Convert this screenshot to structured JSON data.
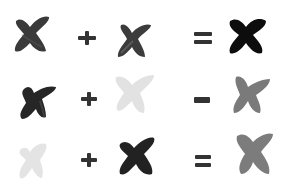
{
  "rows": [
    {
      "operand_a": {
        "shape": "x-brush-mark",
        "color": "#3a3a3a"
      },
      "operator1": "plus",
      "operand_b": {
        "shape": "x-brush-mark",
        "color": "#3c3c3c"
      },
      "operator2": "equals",
      "result": {
        "shape": "x-brush-mark",
        "color": "#0d0d0d"
      }
    },
    {
      "operand_a": {
        "shape": "x-brush-mark",
        "color": "#262626"
      },
      "operator1": "plus",
      "operand_b": {
        "shape": "x-brush-mark",
        "color": "#e2e2e2"
      },
      "operator2": "minus",
      "result": {
        "shape": "x-brush-mark",
        "color": "#7a7a7a"
      }
    },
    {
      "operand_a": {
        "shape": "x-brush-mark",
        "color": "#e4e4e4"
      },
      "operator1": "plus",
      "operand_b": {
        "shape": "x-brush-mark",
        "color": "#222222"
      },
      "operator2": "equals",
      "result": {
        "shape": "x-brush-mark",
        "color": "#7c7c7c"
      }
    }
  ],
  "operator_color": "#333333",
  "background": "#ffffff"
}
